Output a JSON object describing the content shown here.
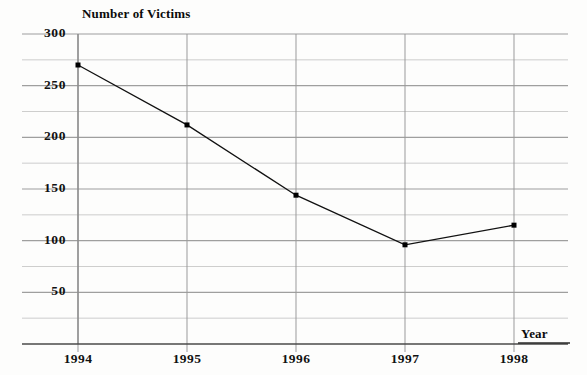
{
  "chart_data": {
    "type": "line",
    "title": "",
    "xlabel": "Year",
    "ylabel": "Number of Victims",
    "categories": [
      "1994",
      "1995",
      "1996",
      "1997",
      "1998"
    ],
    "x": [
      1994,
      1995,
      1996,
      1997,
      1998
    ],
    "values": [
      270,
      212,
      144,
      96,
      115
    ],
    "series": [
      {
        "name": "Number of Victims",
        "values": [
          270,
          212,
          144,
          96,
          115
        ]
      }
    ],
    "ylim": [
      0,
      300
    ],
    "xlim": [
      1993.5,
      1998.5
    ],
    "y_ticks": [
      50,
      100,
      150,
      200,
      250,
      300
    ],
    "y_tick_labels": [
      "50",
      "100",
      "150",
      "200",
      "250",
      "300"
    ],
    "y_minor_step": 25,
    "x_tick_labels": [
      "1994",
      "1995",
      "1996",
      "1997",
      "1998"
    ],
    "grid": true,
    "grid_color": "#9a9a9a",
    "legend": false,
    "legend_position": "none",
    "marker": "square",
    "marker_color": "#000000",
    "line_color": "#111111",
    "background_color": "#fdfdfc",
    "annotations": []
  },
  "labels": {
    "y_axis_title": "Number of Victims",
    "x_axis_title": "Year",
    "y_ticks": [
      "300",
      "250",
      "200",
      "150",
      "100",
      "50"
    ],
    "x_ticks": [
      "1994",
      "1995",
      "1996",
      "1997",
      "1998"
    ]
  }
}
